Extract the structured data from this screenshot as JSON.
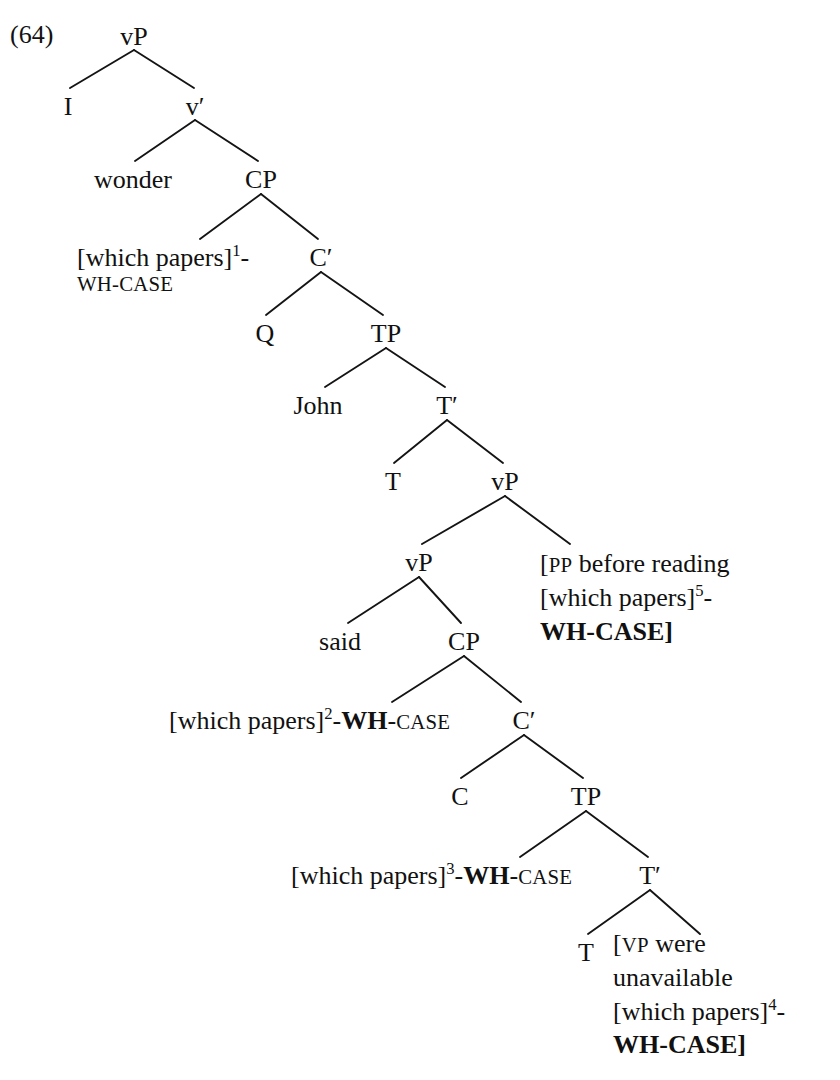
{
  "example": {
    "number": "(64)"
  },
  "tree": {
    "nodes": [
      {
        "id": "vP-top",
        "label": "vP",
        "x": 134,
        "y": 22
      },
      {
        "id": "I",
        "label": "I",
        "x": 68,
        "y": 92
      },
      {
        "id": "v-bar",
        "label": "v′",
        "x": 195,
        "y": 92
      },
      {
        "id": "wonder",
        "label": "wonder",
        "x": 133,
        "y": 165
      },
      {
        "id": "CP-1",
        "label": "CP",
        "x": 261,
        "y": 165
      },
      {
        "id": "C-bar-1",
        "label": "C′",
        "x": 321,
        "y": 243
      },
      {
        "id": "Q",
        "label": "Q",
        "x": 265,
        "y": 319
      },
      {
        "id": "TP-1",
        "label": "TP",
        "x": 386,
        "y": 319
      },
      {
        "id": "John",
        "label": "John",
        "x": 318,
        "y": 391
      },
      {
        "id": "T-bar-1",
        "label": "T′",
        "x": 447,
        "y": 391
      },
      {
        "id": "T-1",
        "label": "T",
        "x": 393,
        "y": 467
      },
      {
        "id": "vP-mid",
        "label": "vP",
        "x": 505,
        "y": 467
      },
      {
        "id": "vP-inner",
        "label": "vP",
        "x": 419,
        "y": 548
      },
      {
        "id": "said",
        "label": "said",
        "x": 340,
        "y": 627
      },
      {
        "id": "CP-2",
        "label": "CP",
        "x": 464,
        "y": 627
      },
      {
        "id": "C-bar-2",
        "label": "C′",
        "x": 524,
        "y": 706
      },
      {
        "id": "C-2",
        "label": "C",
        "x": 460,
        "y": 782
      },
      {
        "id": "TP-2",
        "label": "TP",
        "x": 586,
        "y": 782
      },
      {
        "id": "T-bar-2",
        "label": "T′",
        "x": 650,
        "y": 861
      },
      {
        "id": "T-2",
        "label": "T",
        "x": 586,
        "y": 938
      }
    ],
    "edges": [
      {
        "from": "vP-top",
        "to": "I"
      },
      {
        "from": "vP-top",
        "to": "v-bar"
      },
      {
        "from": "v-bar",
        "to": "wonder"
      },
      {
        "from": "v-bar",
        "to": "CP-1"
      },
      {
        "from": "CP-1",
        "to": "wh1"
      },
      {
        "from": "CP-1",
        "to": "C-bar-1"
      },
      {
        "from": "C-bar-1",
        "to": "Q"
      },
      {
        "from": "C-bar-1",
        "to": "TP-1"
      },
      {
        "from": "TP-1",
        "to": "John"
      },
      {
        "from": "TP-1",
        "to": "T-bar-1"
      },
      {
        "from": "T-bar-1",
        "to": "T-1"
      },
      {
        "from": "T-bar-1",
        "to": "vP-mid"
      },
      {
        "from": "vP-mid",
        "to": "vP-inner"
      },
      {
        "from": "vP-mid",
        "to": "pp"
      },
      {
        "from": "vP-inner",
        "to": "said"
      },
      {
        "from": "vP-inner",
        "to": "CP-2"
      },
      {
        "from": "CP-2",
        "to": "wh2"
      },
      {
        "from": "CP-2",
        "to": "C-bar-2"
      },
      {
        "from": "C-bar-2",
        "to": "C-2"
      },
      {
        "from": "C-bar-2",
        "to": "TP-2"
      },
      {
        "from": "TP-2",
        "to": "wh3"
      },
      {
        "from": "TP-2",
        "to": "T-bar-2"
      },
      {
        "from": "T-bar-2",
        "to": "T-2"
      },
      {
        "from": "T-bar-2",
        "to": "vp-block"
      }
    ],
    "phrases": {
      "wh1": {
        "bracket_open": "[",
        "text": "which papers",
        "bracket_close": "]",
        "index": "1",
        "hyphen": "-",
        "wh_label": "WH",
        "wh_bold": false,
        "sep": "-",
        "case_label": "CASE",
        "case_bold": false,
        "wrap": true,
        "x": 77,
        "y": 243
      },
      "wh2": {
        "bracket_open": "[",
        "text": "which papers",
        "bracket_close": "]",
        "index": "2",
        "hyphen": "-",
        "wh_label": "WH",
        "wh_bold": true,
        "sep": "-",
        "case_label": "CASE",
        "case_bold": false,
        "wrap": false,
        "x": 169,
        "y": 706
      },
      "wh3": {
        "bracket_open": "[",
        "text": "which papers",
        "bracket_close": "]",
        "index": "3",
        "hyphen": "-",
        "wh_label": "WH",
        "wh_bold": true,
        "sep": "-",
        "case_label": "CASE",
        "case_bold": false,
        "wrap": false,
        "x": 291,
        "y": 861
      }
    },
    "blocks": {
      "pp": {
        "bracket_open": "[",
        "category": "PP",
        "line1": "before reading",
        "phrase_open": "[",
        "phrase": "which papers",
        "phrase_close": "]",
        "index": "5",
        "hyphen": "-",
        "feature": "WH-CASE",
        "bracket_close": "]",
        "x": 540,
        "y": 547
      },
      "vp-block": {
        "bracket_open": "[",
        "category": "VP",
        "line1": "were",
        "line2": "unavailable",
        "phrase_open": "[",
        "phrase": "which papers",
        "phrase_close": "]",
        "index": "4",
        "hyphen": "-",
        "feature": "WH-CASE",
        "bracket_close": "]",
        "x": 613,
        "y": 927
      }
    }
  }
}
